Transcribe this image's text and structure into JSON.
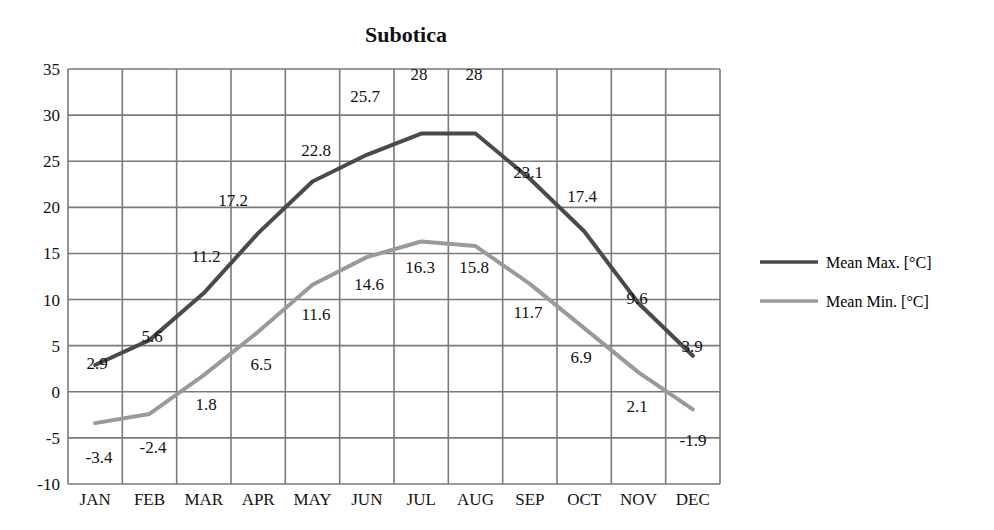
{
  "chart_data": {
    "type": "line",
    "title": "Subotica",
    "xlabel": "",
    "ylabel": "",
    "categories": [
      "JAN",
      "FEB",
      "MAR",
      "APR",
      "MAY",
      "JUN",
      "JUL",
      "AUG",
      "SEP",
      "OCT",
      "NOV",
      "DEC"
    ],
    "series": [
      {
        "name": "Mean Max. [°C]",
        "color": "#4a4a4a",
        "values": [
          2.9,
          5.6,
          11.2,
          17.2,
          22.8,
          25.7,
          28,
          28,
          23.1,
          17.4,
          9.6,
          3.9
        ],
        "plotted": [
          2.9,
          5.6,
          10.7,
          17.2,
          22.8,
          25.7,
          28,
          28,
          23.1,
          17.4,
          9.6,
          3.9
        ]
      },
      {
        "name": "Mean Min. [°C]",
        "color": "#9a9a9a",
        "values": [
          -3.4,
          -2.4,
          1.8,
          6.5,
          11.6,
          14.6,
          16.3,
          15.8,
          11.7,
          6.9,
          2.1,
          -1.9
        ],
        "plotted": [
          -3.4,
          -2.4,
          1.8,
          6.5,
          11.6,
          14.6,
          16.3,
          15.8,
          11.7,
          6.9,
          2.1,
          -1.9
        ]
      }
    ],
    "ylim": [
      -10,
      35
    ],
    "yticks": [
      35,
      30,
      25,
      20,
      15,
      10,
      5,
      0,
      -5,
      -10
    ],
    "grid": true,
    "legend_position": "right"
  }
}
